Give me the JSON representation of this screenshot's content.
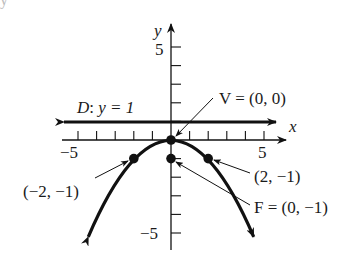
{
  "figure": {
    "top_cut_text": "           y",
    "axes": {
      "x_label": "x",
      "y_label": "y",
      "x_tick_labels": [
        {
          "value": -5,
          "text": "−5"
        },
        {
          "value": 5,
          "text": "5"
        }
      ],
      "y_tick_labels": [
        {
          "value": 5,
          "text": "5"
        },
        {
          "value": -5,
          "text": "−5"
        }
      ],
      "x_range": [
        -5,
        5
      ],
      "y_range": [
        -6,
        6
      ]
    },
    "directrix": {
      "label": "D: y = 1",
      "label_italic_part": "D",
      "equation": "y = 1",
      "y": 1
    },
    "parabola": {
      "equation": "y = -x^2/4",
      "opens": "down"
    },
    "points": [
      {
        "name": "vertex",
        "x": 0,
        "y": 0,
        "label": "V = (0, 0)"
      },
      {
        "name": "focus",
        "x": 0,
        "y": -1,
        "label": "F = (0, −1)"
      },
      {
        "name": "left-point",
        "x": -2,
        "y": -1,
        "label": "(−2, −1)"
      },
      {
        "name": "right-point",
        "x": 2,
        "y": -1,
        "label": "(2, −1)"
      }
    ],
    "colors": {
      "ink": "#111111",
      "background": "#ffffff"
    }
  }
}
